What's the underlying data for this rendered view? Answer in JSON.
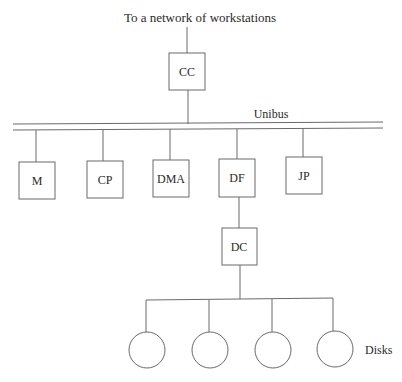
{
  "diagram": {
    "title": "To a network of workstations",
    "bus_label": "Unibus",
    "top_node": {
      "id": "cc",
      "label": "CC"
    },
    "bus_nodes": [
      {
        "id": "m",
        "label": "M"
      },
      {
        "id": "cp",
        "label": "CP"
      },
      {
        "id": "dma",
        "label": "DMA"
      },
      {
        "id": "df",
        "label": "DF"
      },
      {
        "id": "jp",
        "label": "JP"
      }
    ],
    "controller_node": {
      "id": "dc",
      "label": "DC"
    },
    "disks": {
      "count": 4,
      "label": "Disks"
    },
    "edges": [
      [
        "network",
        "cc"
      ],
      [
        "cc",
        "unibus"
      ],
      [
        "unibus",
        "m"
      ],
      [
        "unibus",
        "cp"
      ],
      [
        "unibus",
        "dma"
      ],
      [
        "unibus",
        "df"
      ],
      [
        "unibus",
        "jp"
      ],
      [
        "df",
        "dc"
      ],
      [
        "dc",
        "disk-1"
      ],
      [
        "dc",
        "disk-2"
      ],
      [
        "dc",
        "disk-3"
      ],
      [
        "dc",
        "disk-4"
      ]
    ],
    "colors": {
      "line": "#6a6a6a",
      "text": "#2a2a2a",
      "background": "#ffffff"
    }
  }
}
